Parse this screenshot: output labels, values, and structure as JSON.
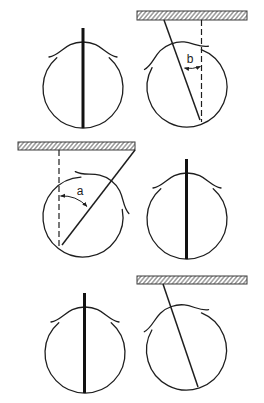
{
  "figure": {
    "layout": {
      "rows": 3,
      "columns": 2
    },
    "panels": [
      {
        "id": "top-left",
        "description": "eye with thick vertical rod, no tilt",
        "tilt_deg": 0,
        "reference_bar": false
      },
      {
        "id": "top-right",
        "description": "eye tilted with line hanging from hatched bar, dashed vertical reference",
        "tilt_deg": -20,
        "reference_bar": true,
        "angle_label": "b"
      },
      {
        "id": "middle-left",
        "description": "eye tilted with line from hatched bar, dashed vertical reference",
        "tilt_deg": 38,
        "reference_bar": true,
        "angle_label": "a"
      },
      {
        "id": "middle-right",
        "description": "eye with thick vertical rod, no tilt",
        "tilt_deg": 0,
        "reference_bar": false
      },
      {
        "id": "bottom-left",
        "description": "eye with thick vertical rod, no tilt",
        "tilt_deg": 0,
        "reference_bar": false
      },
      {
        "id": "bottom-right",
        "description": "eye tilted with line hanging from hatched bar",
        "tilt_deg": -19,
        "reference_bar": true
      }
    ],
    "labels": {
      "angle_a": "a",
      "angle_b": "b"
    },
    "colors": {
      "line": "#1e1e1e",
      "background": "#ffffff"
    }
  }
}
